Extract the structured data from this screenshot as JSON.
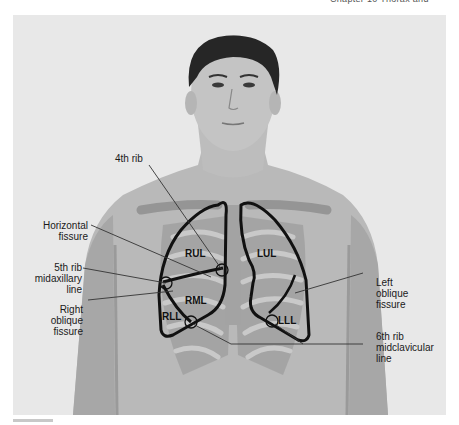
{
  "header": {
    "fragment_text": "Chapter 10  Thorax and Lungs"
  },
  "figure": {
    "colors": {
      "background": "#e8e8e8",
      "skin": "#b9b9b9",
      "skin_shadow": "#9f9f9f",
      "hair": "#262626",
      "ribs": "#8e8e8e",
      "rib_highlight": "#c9c9c9",
      "outline": "#111111",
      "leader_line": "#333333"
    },
    "lobes": {
      "rul": "RUL",
      "rml": "RML",
      "rll": "RLL",
      "lul": "LUL",
      "lll": "LLL"
    },
    "callouts": {
      "fourth_rib": "4th rib",
      "horizontal_fissure": [
        "Horizontal",
        "fissure"
      ],
      "fifth_rib": [
        "5th rib",
        "midaxillary",
        "line"
      ],
      "right_oblique": [
        "Right",
        "oblique",
        "fissure"
      ],
      "left_oblique": [
        "Left",
        "oblique",
        "fissure"
      ],
      "sixth_rib": [
        "6th rib",
        "midclavicular",
        "line"
      ]
    }
  }
}
